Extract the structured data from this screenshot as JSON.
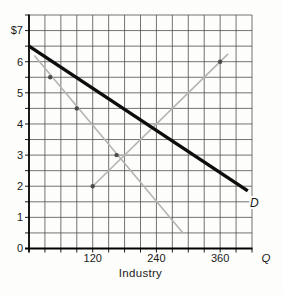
{
  "chart_data": {
    "type": "line",
    "title": "",
    "xlabel": "Industry",
    "ylabel": "Price ($)",
    "x_axis_end_label": "Q",
    "y_axis_top_label": "$7",
    "xlim": [
      0,
      420
    ],
    "ylim": [
      0,
      7.5
    ],
    "x_grid_step": 30,
    "y_grid_step": 0.5,
    "grid": {
      "show": true,
      "color": "#4f4f4f"
    },
    "axis_color": "#000000",
    "legend": "none",
    "x_ticks": [
      {
        "q": 120,
        "label": "120"
      },
      {
        "q": 240,
        "label": "240"
      },
      {
        "q": 360,
        "label": "360"
      }
    ],
    "y_ticks": [
      {
        "v": 0,
        "label": "0"
      },
      {
        "v": 1,
        "label": "1"
      },
      {
        "v": 2,
        "label": "2"
      },
      {
        "v": 3,
        "label": "3"
      },
      {
        "v": 4,
        "label": "4"
      },
      {
        "v": 5,
        "label": "5"
      },
      {
        "v": 6,
        "label": "6"
      },
      {
        "v": 7,
        "label": "$7"
      }
    ],
    "series": [
      {
        "name": "demand-curve-D",
        "label": "D",
        "color": "#0d0d0d",
        "width": 3.4,
        "points": [
          [
            0,
            6.5
          ],
          [
            412,
            1.85
          ]
        ],
        "label_at": [
          416,
          1.32
        ]
      },
      {
        "name": "declining-gray-line",
        "label": "",
        "color": "#b4b4b4",
        "width": 1.6,
        "points": [
          [
            10,
            6.2
          ],
          [
            290,
            0.5
          ]
        ]
      },
      {
        "name": "rising-gray-line",
        "label": "",
        "color": "#b4b4b4",
        "width": 1.6,
        "points": [
          [
            120,
            2.0
          ],
          [
            375,
            6.25
          ]
        ]
      }
    ],
    "point_markers": {
      "color": "#4a4a4a",
      "radius": 2.2,
      "points": [
        [
          40,
          5.5
        ],
        [
          90,
          4.5
        ],
        [
          165,
          3.0
        ],
        [
          120,
          2.0
        ],
        [
          360,
          6.0
        ]
      ]
    }
  }
}
